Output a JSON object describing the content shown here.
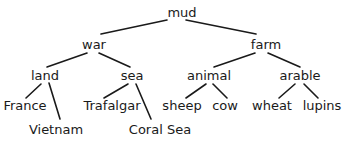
{
  "tree": {
    "root": "mud",
    "nodes": [
      {
        "id": "mud",
        "label": "mud",
        "x": 182,
        "y": 12
      },
      {
        "id": "war",
        "label": "war",
        "x": 94,
        "y": 44
      },
      {
        "id": "farm",
        "label": "farm",
        "x": 266,
        "y": 44
      },
      {
        "id": "land",
        "label": "land",
        "x": 45,
        "y": 75
      },
      {
        "id": "sea",
        "label": "sea",
        "x": 132,
        "y": 75
      },
      {
        "id": "animal",
        "label": "animal",
        "x": 209,
        "y": 75
      },
      {
        "id": "arable",
        "label": "arable",
        "x": 300,
        "y": 75
      },
      {
        "id": "france",
        "label": "France",
        "x": 25,
        "y": 105
      },
      {
        "id": "vietnam",
        "label": "Vietnam",
        "x": 56,
        "y": 129
      },
      {
        "id": "trafalgar",
        "label": "Trafalgar",
        "x": 112,
        "y": 105
      },
      {
        "id": "coral-sea",
        "label": "Coral Sea",
        "x": 160,
        "y": 129
      },
      {
        "id": "sheep",
        "label": "sheep",
        "x": 182,
        "y": 105
      },
      {
        "id": "cow",
        "label": "cow",
        "x": 225,
        "y": 105
      },
      {
        "id": "wheat",
        "label": "wheat",
        "x": 272,
        "y": 105
      },
      {
        "id": "lupins",
        "label": "lupins",
        "x": 322,
        "y": 105
      }
    ],
    "edges": [
      {
        "from": "mud",
        "to": "war",
        "x1": 167,
        "y1": 20,
        "x2": 101,
        "y2": 34
      },
      {
        "from": "mud",
        "to": "farm",
        "x1": 186,
        "y1": 20,
        "x2": 256,
        "y2": 34
      },
      {
        "from": "war",
        "to": "land",
        "x1": 87,
        "y1": 53,
        "x2": 47,
        "y2": 67
      },
      {
        "from": "war",
        "to": "sea",
        "x1": 99,
        "y1": 53,
        "x2": 130,
        "y2": 67
      },
      {
        "from": "farm",
        "to": "animal",
        "x1": 255,
        "y1": 53,
        "x2": 214,
        "y2": 67
      },
      {
        "from": "farm",
        "to": "arable",
        "x1": 268,
        "y1": 53,
        "x2": 300,
        "y2": 67
      },
      {
        "from": "land",
        "to": "france",
        "x1": 41,
        "y1": 84,
        "x2": 26,
        "y2": 98
      },
      {
        "from": "land",
        "to": "vietnam",
        "x1": 49,
        "y1": 83,
        "x2": 60,
        "y2": 119
      },
      {
        "from": "sea",
        "to": "trafalgar",
        "x1": 128,
        "y1": 84,
        "x2": 104,
        "y2": 98
      },
      {
        "from": "sea",
        "to": "coral-sea",
        "x1": 136,
        "y1": 84,
        "x2": 151,
        "y2": 119
      },
      {
        "from": "animal",
        "to": "sheep",
        "x1": 206,
        "y1": 84,
        "x2": 186,
        "y2": 98
      },
      {
        "from": "animal",
        "to": "cow",
        "x1": 213,
        "y1": 84,
        "x2": 227,
        "y2": 98
      },
      {
        "from": "arable",
        "to": "wheat",
        "x1": 295,
        "y1": 84,
        "x2": 279,
        "y2": 98
      },
      {
        "from": "arable",
        "to": "lupins",
        "x1": 304,
        "y1": 84,
        "x2": 318,
        "y2": 98
      }
    ]
  },
  "colors": {
    "text": "#1a1a1a",
    "line": "#1a1a1a",
    "background": "#ffffff"
  }
}
